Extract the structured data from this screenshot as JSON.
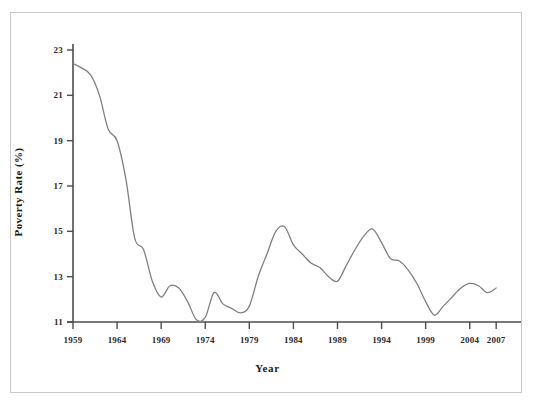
{
  "chart_data": {
    "type": "line",
    "title": "",
    "xlabel": "Year",
    "ylabel": "Poverty Rate (%)",
    "xlim": [
      1959,
      2008
    ],
    "ylim": [
      11,
      23
    ],
    "grid": false,
    "legend": "none",
    "line_color": "#808080",
    "axis_color": "#4d4d4d",
    "background_color": "#ffffff",
    "frame_color": "#c9c9c9",
    "xticks": [
      "1959",
      "1964",
      "1969",
      "1974",
      "1979",
      "1984",
      "1989",
      "1994",
      "1999",
      "2004",
      "2007"
    ],
    "xtick_values": [
      1959,
      1964,
      1969,
      1974,
      1979,
      1984,
      1989,
      1994,
      1999,
      2004,
      2007
    ],
    "yticks": [
      "11",
      "13",
      "15",
      "17",
      "19",
      "21",
      "23"
    ],
    "ytick_values": [
      11,
      13,
      15,
      17,
      19,
      21,
      23
    ],
    "series": [
      {
        "name": "Poverty Rate",
        "x": [
          1959,
          1960,
          1961,
          1962,
          1963,
          1964,
          1965,
          1966,
          1967,
          1968,
          1969,
          1970,
          1971,
          1972,
          1973,
          1974,
          1975,
          1976,
          1977,
          1978,
          1979,
          1980,
          1981,
          1982,
          1983,
          1984,
          1985,
          1986,
          1987,
          1988,
          1989,
          1990,
          1991,
          1992,
          1993,
          1994,
          1995,
          1996,
          1997,
          1998,
          1999,
          2000,
          2001,
          2002,
          2003,
          2004,
          2005,
          2006,
          2007
        ],
        "values": [
          22.4,
          22.2,
          21.9,
          21.0,
          19.5,
          19.0,
          17.3,
          14.7,
          14.2,
          12.8,
          12.1,
          12.6,
          12.5,
          11.9,
          11.1,
          11.2,
          12.3,
          11.8,
          11.6,
          11.4,
          11.7,
          13.0,
          14.0,
          15.0,
          15.2,
          14.4,
          14.0,
          13.6,
          13.4,
          13.0,
          12.8,
          13.5,
          14.2,
          14.8,
          15.1,
          14.5,
          13.8,
          13.7,
          13.3,
          12.7,
          11.9,
          11.3,
          11.7,
          12.1,
          12.5,
          12.7,
          12.6,
          12.3,
          12.5
        ]
      }
    ]
  },
  "axis_titles": {
    "x": "Year",
    "y": "Poverty Rate (%)"
  }
}
